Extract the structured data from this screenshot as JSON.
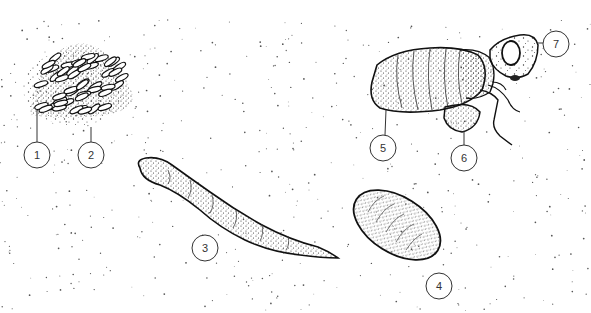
{
  "diagram": {
    "background": "#ffffff",
    "ink_color": "#1a1a1a",
    "stipple_color": "#555555",
    "labels": [
      {
        "id": "1",
        "text": "1",
        "cx": 37,
        "cy": 155,
        "leader": [
          37,
          142,
          37,
          110
        ]
      },
      {
        "id": "2",
        "text": "2",
        "cx": 91,
        "cy": 155,
        "leader": [
          91,
          142,
          91,
          127
        ]
      },
      {
        "id": "3",
        "text": "3",
        "cx": 205,
        "cy": 248,
        "leader": null
      },
      {
        "id": "4",
        "text": "4",
        "cx": 439,
        "cy": 286,
        "leader": null
      },
      {
        "id": "5",
        "text": "5",
        "cx": 383,
        "cy": 148,
        "leader": [
          385,
          135,
          386,
          110
        ]
      },
      {
        "id": "6",
        "text": "6",
        "cx": 464,
        "cy": 158,
        "leader": [
          464,
          145,
          464,
          131
        ]
      },
      {
        "id": "7",
        "text": "7",
        "cx": 556,
        "cy": 44,
        "leader": [
          543,
          43,
          537,
          43
        ]
      }
    ],
    "figures": [
      {
        "name": "egg-cluster",
        "description": "cluster of elongated eggs"
      },
      {
        "name": "larva",
        "description": "elongated segmented larva with tapering tail"
      },
      {
        "name": "pupa",
        "description": "oval segmented pupa"
      },
      {
        "name": "adult-emerging",
        "description": "adult insect with large eye, segmented abdomen, wing and legs"
      }
    ]
  }
}
